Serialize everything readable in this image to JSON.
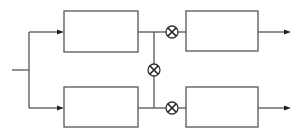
{
  "diagram": {
    "type": "block-diagram",
    "colors": {
      "line": "#555555",
      "background": "#ffffff",
      "multiplier": "#222222"
    },
    "input": {
      "x1": 12,
      "x2": 29,
      "y": 70
    },
    "split": {
      "x": 29,
      "y1": 32,
      "y2": 108
    },
    "blocks": [
      {
        "id": "block-top-left",
        "x": 64,
        "y": 11,
        "w": 74,
        "h": 41,
        "label": ""
      },
      {
        "id": "block-bottom-left",
        "x": 64,
        "y": 87,
        "w": 74,
        "h": 40,
        "label": ""
      },
      {
        "id": "block-top-right",
        "x": 186,
        "y": 11,
        "w": 72,
        "h": 40,
        "label": ""
      },
      {
        "id": "block-bottom-right",
        "x": 186,
        "y": 87,
        "w": 72,
        "h": 40,
        "label": ""
      }
    ],
    "multipliers": [
      {
        "id": "multiplier-top",
        "cx": 172,
        "cy": 32,
        "r": 6,
        "symbol": "⊗"
      },
      {
        "id": "multiplier-center",
        "cx": 154,
        "cy": 70,
        "r": 6,
        "symbol": "⊗"
      },
      {
        "id": "multiplier-bottom",
        "cx": 172,
        "cy": 108,
        "r": 6,
        "symbol": "⊗"
      }
    ],
    "outputs": [
      {
        "id": "output-top",
        "x1": 258,
        "x2": 290,
        "y": 32
      },
      {
        "id": "output-bottom",
        "x1": 258,
        "x2": 290,
        "y": 108
      }
    ]
  }
}
